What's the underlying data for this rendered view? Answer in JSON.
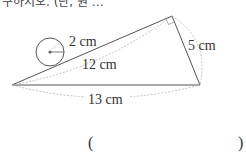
{
  "header": {
    "cut_text": "구하시오. (단, 원 …"
  },
  "diagram": {
    "labels": {
      "radius": "2 cm",
      "hypotenuse_inner": "12 cm",
      "right_side": "5 cm",
      "base": "13 cm"
    },
    "colors": {
      "line": "#555555",
      "dashed": "#aaaaaa"
    }
  },
  "answer": {
    "open_paren": "(",
    "close_paren": ")"
  }
}
